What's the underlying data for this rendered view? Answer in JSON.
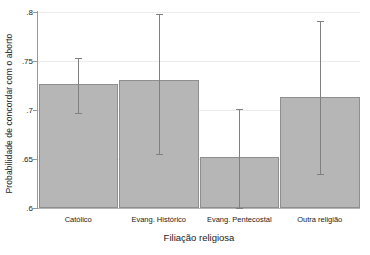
{
  "chart_data": {
    "type": "bar",
    "title": "",
    "xlabel": "Filiação religiosa",
    "ylabel": "Probabilidade de concordar com o aborto",
    "categories": [
      "Católico",
      "Evang. Histórico",
      "Evang. Pentecostal",
      "Outra religião"
    ],
    "values": [
      0.727,
      0.731,
      0.652,
      0.713
    ],
    "errors_low": [
      0.697,
      0.655,
      0.6,
      0.635
    ],
    "errors_high": [
      0.753,
      0.798,
      0.701,
      0.791
    ],
    "ylim": [
      0.6,
      0.8
    ],
    "yticks": [
      0.6,
      0.65,
      0.7,
      0.75,
      0.8
    ],
    "ytick_labels": [
      ".6",
      ".65",
      ".7",
      ".75",
      ".8"
    ],
    "grid": false,
    "legend": "none",
    "bar_color": "#b6b6b6",
    "bar_edge_color": "#8e8e8e",
    "error_color": "#808080",
    "background": "#ffffff"
  }
}
